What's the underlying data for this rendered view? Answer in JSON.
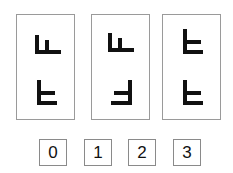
{
  "puzzle": {
    "panels": [
      {
        "id": "panel-1",
        "top_glyph": "glyph-A",
        "bottom_glyph": "glyph-B"
      },
      {
        "id": "panel-2",
        "top_glyph": "glyph-A",
        "bottom_glyph": "glyph-B-mirrored"
      },
      {
        "id": "panel-3",
        "top_glyph": "glyph-B",
        "bottom_glyph": "glyph-B"
      }
    ],
    "answers": [
      {
        "label": "0"
      },
      {
        "label": "1"
      },
      {
        "label": "2"
      },
      {
        "label": "3"
      }
    ],
    "colors": {
      "ink": "#111111",
      "border": "#9a9a9a",
      "background": "#ffffff"
    }
  }
}
